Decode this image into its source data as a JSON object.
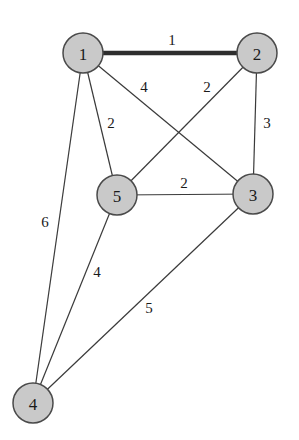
{
  "diagram": {
    "type": "weighted-undirected-graph",
    "nodes": [
      {
        "id": "1",
        "label": "1",
        "x": 83,
        "y": 53
      },
      {
        "id": "2",
        "label": "2",
        "x": 257,
        "y": 53
      },
      {
        "id": "3",
        "label": "3",
        "x": 253,
        "y": 194
      },
      {
        "id": "4",
        "label": "4",
        "x": 33,
        "y": 403
      },
      {
        "id": "5",
        "label": "5",
        "x": 117,
        "y": 195
      }
    ],
    "edges": [
      {
        "from": "1",
        "to": "2",
        "weight": "1",
        "highlighted": true,
        "label_x": 172,
        "label_y": 40
      },
      {
        "from": "1",
        "to": "3",
        "weight": "4",
        "highlighted": false,
        "label_x": 144,
        "label_y": 87
      },
      {
        "from": "1",
        "to": "5",
        "weight": "2",
        "highlighted": false,
        "label_x": 111,
        "label_y": 123
      },
      {
        "from": "1",
        "to": "4",
        "weight": "6",
        "highlighted": false,
        "label_x": 45,
        "label_y": 222
      },
      {
        "from": "2",
        "to": "5",
        "weight": "2",
        "highlighted": false,
        "label_x": 207,
        "label_y": 87
      },
      {
        "from": "2",
        "to": "3",
        "weight": "3",
        "highlighted": false,
        "label_x": 267,
        "label_y": 123
      },
      {
        "from": "5",
        "to": "3",
        "weight": "2",
        "highlighted": false,
        "label_x": 184,
        "label_y": 183
      },
      {
        "from": "5",
        "to": "4",
        "weight": "4",
        "highlighted": false,
        "label_x": 97,
        "label_y": 272
      },
      {
        "from": "3",
        "to": "4",
        "weight": "5",
        "highlighted": false,
        "label_x": 149,
        "label_y": 308
      }
    ],
    "node_radius": 20,
    "colors": {
      "node_fill": "#c9c9c9",
      "node_stroke": "#4a4a4a",
      "edge": "#3a3a3a",
      "highlighted_edge": "#2e2e2e",
      "background": "#ffffff"
    }
  }
}
